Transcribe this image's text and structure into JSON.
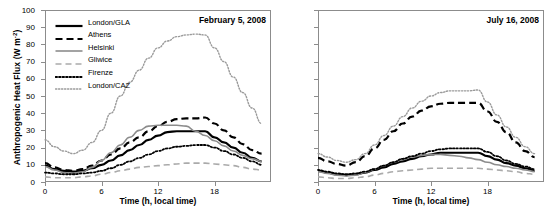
{
  "figure": {
    "ylabel": "Anthropogenic Heat Flux (W m",
    "ylabel_exp": "-2",
    "ylabel_close": ")",
    "xlabel": "Time (h, local time)",
    "axis_color": "#8c8c8c"
  },
  "legend": {
    "items": [
      {
        "label": "London/GLA",
        "style": "solid",
        "color": "#000000",
        "width": 2.2
      },
      {
        "label": "Athens",
        "style": "dashed",
        "color": "#000000",
        "width": 2.2
      },
      {
        "label": "Helsinki",
        "style": "solid",
        "color": "#8c8c8c",
        "width": 1.6
      },
      {
        "label": "Gliwice",
        "style": "dashed",
        "color": "#aaaaaa",
        "width": 1.6
      },
      {
        "label": "Firenze",
        "style": "dotted",
        "color": "#000000",
        "width": 1.8
      },
      {
        "label": "London/CAZ",
        "style": "dotted",
        "color": "#9a9a9a",
        "width": 1.4
      }
    ]
  },
  "chart_data": [
    {
      "type": "line",
      "panel": "left",
      "title": "February 5, 2008",
      "xlabel": "Time (h, local time)",
      "ylabel": "Anthropogenic Heat Flux (W m-2)",
      "xlim": [
        0,
        24
      ],
      "ylim": [
        0,
        100
      ],
      "xticks": [
        0,
        6,
        12,
        18
      ],
      "yticks": [
        0,
        10,
        20,
        30,
        40,
        50,
        60,
        70,
        80,
        90,
        100
      ],
      "grid": false,
      "legend_position": "upper-left",
      "x": [
        0,
        1,
        2,
        3,
        4,
        5,
        6,
        7,
        8,
        9,
        10,
        11,
        12,
        13,
        14,
        15,
        16,
        17,
        18,
        19,
        20,
        21,
        22,
        23
      ],
      "series": [
        {
          "name": "London/GLA",
          "values": [
            9.5,
            7.5,
            6.5,
            6.0,
            6.5,
            8.0,
            10.0,
            12.5,
            15.5,
            18.5,
            21.5,
            24.5,
            27.0,
            29.0,
            29.5,
            29.5,
            29.5,
            29.5,
            26.0,
            23.0,
            20.0,
            17.0,
            14.0,
            12.0
          ]
        },
        {
          "name": "Athens",
          "values": [
            11.0,
            8.5,
            7.0,
            6.5,
            7.5,
            9.5,
            12.5,
            16.0,
            19.5,
            23.0,
            26.0,
            29.5,
            32.5,
            35.0,
            36.5,
            37.0,
            37.0,
            37.5,
            34.0,
            30.0,
            26.0,
            22.0,
            18.5,
            16.5
          ]
        },
        {
          "name": "Helsinki",
          "values": [
            9.0,
            7.0,
            5.5,
            5.0,
            6.0,
            8.5,
            12.5,
            17.0,
            21.5,
            26.0,
            30.0,
            32.5,
            33.0,
            33.0,
            33.0,
            32.5,
            29.5,
            27.0,
            24.0,
            21.0,
            18.0,
            15.5,
            13.5,
            12.0
          ]
        },
        {
          "name": "Gliwice",
          "values": [
            3.0,
            2.5,
            2.5,
            2.5,
            3.0,
            3.5,
            4.5,
            5.5,
            6.5,
            7.5,
            8.5,
            9.0,
            9.5,
            10.0,
            10.5,
            11.0,
            11.0,
            11.0,
            10.5,
            10.0,
            9.5,
            8.5,
            7.5,
            7.0
          ]
        },
        {
          "name": "Firenze",
          "values": [
            5.5,
            5.0,
            4.5,
            4.5,
            5.0,
            5.5,
            6.5,
            8.0,
            10.0,
            12.0,
            14.0,
            16.0,
            18.0,
            19.5,
            20.5,
            21.0,
            21.5,
            21.5,
            20.0,
            18.0,
            16.0,
            14.0,
            12.0,
            10.0
          ]
        },
        {
          "name": "London/CAZ",
          "values": [
            24.5,
            20.5,
            18.0,
            16.5,
            18.5,
            23.0,
            30.0,
            40.0,
            50.0,
            58.0,
            65.0,
            72.0,
            78.0,
            82.0,
            84.5,
            85.5,
            86.0,
            85.5,
            78.0,
            70.0,
            61.0,
            52.0,
            43.0,
            34.0
          ]
        }
      ]
    },
    {
      "type": "line",
      "panel": "right",
      "title": "July 16, 2008",
      "xlabel": "Time (h, local time)",
      "ylabel": "Anthropogenic Heat Flux (W m-2)",
      "xlim": [
        0,
        24
      ],
      "ylim": [
        0,
        100
      ],
      "xticks": [
        0,
        6,
        12,
        18
      ],
      "yticks": [
        0,
        10,
        20,
        30,
        40,
        50,
        60,
        70,
        80,
        90,
        100
      ],
      "grid": false,
      "legend_position": "none",
      "x": [
        0,
        1,
        2,
        3,
        4,
        5,
        6,
        7,
        8,
        9,
        10,
        11,
        12,
        13,
        14,
        15,
        16,
        17,
        18,
        19,
        20,
        21,
        22,
        23
      ],
      "series": [
        {
          "name": "London/GLA",
          "values": [
            6.5,
            5.5,
            4.5,
            4.0,
            4.5,
            5.5,
            7.0,
            8.5,
            10.5,
            12.0,
            13.5,
            15.0,
            16.0,
            17.0,
            17.0,
            17.0,
            17.0,
            17.0,
            15.0,
            13.0,
            11.0,
            9.5,
            8.0,
            6.5
          ]
        },
        {
          "name": "Athens",
          "values": [
            14.0,
            12.0,
            10.5,
            9.5,
            11.5,
            15.0,
            19.5,
            24.5,
            29.5,
            34.0,
            38.0,
            41.5,
            44.0,
            45.5,
            46.0,
            46.0,
            46.0,
            46.0,
            41.0,
            35.0,
            29.0,
            23.0,
            18.0,
            14.5
          ]
        },
        {
          "name": "Helsinki",
          "values": [
            6.0,
            5.0,
            4.0,
            3.5,
            4.0,
            5.5,
            7.5,
            9.5,
            11.5,
            13.0,
            14.5,
            15.5,
            16.0,
            16.0,
            15.5,
            15.0,
            14.0,
            13.0,
            11.5,
            10.0,
            9.0,
            8.0,
            7.0,
            6.0
          ]
        },
        {
          "name": "Gliwice",
          "values": [
            3.0,
            2.5,
            2.0,
            2.0,
            2.5,
            3.0,
            4.0,
            5.0,
            6.0,
            6.5,
            7.0,
            7.5,
            8.0,
            8.0,
            8.0,
            8.0,
            8.0,
            8.0,
            7.5,
            7.0,
            6.5,
            6.0,
            5.0,
            4.5
          ]
        },
        {
          "name": "Firenze",
          "values": [
            7.0,
            6.0,
            5.0,
            4.5,
            5.0,
            6.0,
            7.5,
            9.5,
            11.5,
            13.5,
            15.0,
            16.5,
            18.0,
            19.0,
            19.5,
            19.5,
            19.5,
            19.5,
            17.5,
            15.0,
            12.5,
            10.5,
            9.0,
            7.5
          ]
        },
        {
          "name": "London/CAZ",
          "values": [
            16.5,
            14.5,
            12.5,
            11.5,
            13.0,
            16.5,
            21.5,
            27.0,
            32.5,
            38.0,
            43.0,
            47.0,
            50.0,
            52.0,
            53.0,
            53.0,
            53.0,
            53.5,
            46.5,
            39.0,
            32.0,
            26.0,
            20.5,
            16.5
          ]
        }
      ]
    }
  ]
}
